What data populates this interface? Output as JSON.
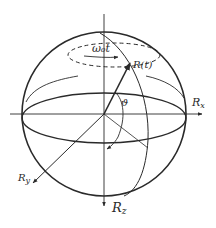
{
  "diagram": {
    "type": "bloch-sphere-rotation",
    "colors": {
      "ink": "#2a2a2a",
      "background": "#ffffff"
    },
    "labels": {
      "precession": "ω₀t",
      "vector": "R(t)",
      "angle": "ϑ",
      "axis_x": "R",
      "axis_x_sub": "x",
      "axis_y": "R",
      "axis_y_sub": "y",
      "axis_z": "R",
      "axis_z_sub": "z"
    }
  }
}
